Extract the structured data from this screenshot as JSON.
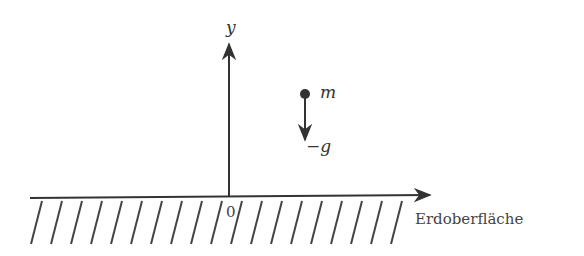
{
  "diagram": {
    "type": "free-fall coordinate system",
    "axis_y_label": "y",
    "origin_label": "0",
    "mass_label": "m",
    "gravity_label": "−g",
    "surface_label": "Erdoberfläche",
    "colors": {
      "stroke": "#333333",
      "text": "#444444",
      "background": "#ffffff"
    }
  }
}
